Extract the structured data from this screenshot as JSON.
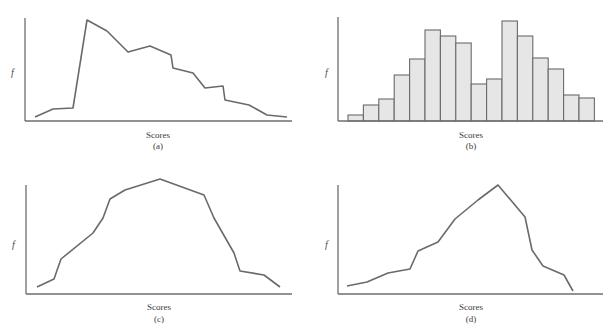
{
  "figure": {
    "panels": [
      {
        "id": "a",
        "ylabel": "f",
        "xlabel": "Scores",
        "caption": "(a)"
      },
      {
        "id": "b",
        "ylabel": "f",
        "xlabel": "Scores",
        "caption": "(b)"
      },
      {
        "id": "c",
        "ylabel": "f",
        "xlabel": "Scores",
        "caption": "(c)"
      },
      {
        "id": "d",
        "ylabel": "f",
        "xlabel": "Scores",
        "caption": "(d)"
      }
    ]
  },
  "chart_data": [
    {
      "panel": "a",
      "type": "line",
      "title": "",
      "xlabel": "Scores",
      "ylabel": "f",
      "caption": "(a)",
      "grid": false,
      "description": "Frequency polygon, positively skewed (sharp rise then gradual tail to the right)",
      "x": [
        1,
        2,
        3,
        4,
        5,
        6,
        7,
        8,
        9,
        10,
        11,
        12,
        13,
        14,
        15,
        16,
        17,
        18
      ],
      "values": [
        3,
        11,
        12,
        100,
        89,
        68,
        74,
        65,
        52,
        47,
        32,
        34,
        20,
        15,
        5,
        3
      ],
      "points_px": [
        [
          35,
          117
        ],
        [
          53,
          109
        ],
        [
          73,
          108
        ],
        [
          87,
          20
        ],
        [
          107,
          31
        ],
        [
          128,
          52
        ],
        [
          150,
          46
        ],
        [
          171,
          55
        ],
        [
          173,
          68
        ],
        [
          193,
          73
        ],
        [
          205,
          88
        ],
        [
          223,
          86
        ],
        [
          225,
          100
        ],
        [
          249,
          105
        ],
        [
          267,
          115
        ],
        [
          287,
          117
        ]
      ]
    },
    {
      "panel": "b",
      "type": "bar",
      "title": "",
      "xlabel": "Scores",
      "ylabel": "f",
      "caption": "(b)",
      "grid": false,
      "description": "Histogram, bimodal distribution",
      "categories": [
        "1",
        "2",
        "3",
        "4",
        "5",
        "6",
        "7",
        "8",
        "9",
        "10",
        "11",
        "12",
        "13",
        "14",
        "15",
        "16"
      ],
      "values": [
        6,
        16,
        22,
        46,
        62,
        91,
        85,
        78,
        37,
        42,
        100,
        85,
        63,
        52,
        26,
        23
      ]
    },
    {
      "panel": "c",
      "type": "line",
      "title": "",
      "xlabel": "Scores",
      "ylabel": "f",
      "caption": "(c)",
      "grid": false,
      "description": "Frequency polygon, roughly symmetrical bell-shaped distribution",
      "values": [
        6,
        13,
        33,
        56,
        70,
        88,
        96,
        100,
        85,
        64,
        31,
        15,
        12,
        1
      ],
      "points_px": [
        [
          37,
          287
        ],
        [
          54,
          279
        ],
        [
          61,
          259
        ],
        [
          93,
          233
        ],
        [
          103,
          218
        ],
        [
          110,
          199
        ],
        [
          125,
          190
        ],
        [
          160,
          179
        ],
        [
          204,
          195
        ],
        [
          214,
          218
        ],
        [
          234,
          253
        ],
        [
          240,
          271
        ],
        [
          264,
          275
        ],
        [
          280,
          287
        ]
      ]
    },
    {
      "panel": "d",
      "type": "line",
      "title": "",
      "xlabel": "Scores",
      "ylabel": "f",
      "caption": "(d)",
      "grid": false,
      "description": "Frequency polygon, negatively skewed (gradual rise with sharp drop on the right)",
      "values": [
        7,
        11,
        19,
        23,
        39,
        47,
        68,
        85,
        100,
        70,
        42,
        27,
        17,
        3
      ],
      "points_px": [
        [
          347,
          286
        ],
        [
          367,
          282
        ],
        [
          388,
          273
        ],
        [
          410,
          269
        ],
        [
          418,
          251
        ],
        [
          438,
          242
        ],
        [
          455,
          219
        ],
        [
          478,
          200
        ],
        [
          498,
          185
        ],
        [
          525,
          217
        ],
        [
          532,
          250
        ],
        [
          543,
          266
        ],
        [
          564,
          275
        ],
        [
          573,
          291
        ]
      ]
    }
  ]
}
